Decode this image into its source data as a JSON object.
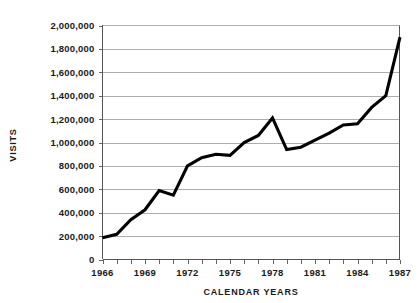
{
  "chart_data": {
    "type": "line",
    "title": "",
    "xlabel": "CALENDAR YEARS",
    "ylabel": "VISITS",
    "x": [
      1966,
      1967,
      1968,
      1969,
      1970,
      1971,
      1972,
      1973,
      1974,
      1975,
      1976,
      1977,
      1978,
      1979,
      1980,
      1981,
      1982,
      1983,
      1984,
      1985,
      1986,
      1987
    ],
    "values": [
      185000,
      215000,
      340000,
      425000,
      590000,
      550000,
      800000,
      870000,
      900000,
      890000,
      1000000,
      1060000,
      1210000,
      940000,
      960000,
      1020000,
      1080000,
      1150000,
      1160000,
      1300000,
      1400000,
      1900000
    ],
    "series": [
      {
        "name": "Visits",
        "values": [
          185000,
          215000,
          340000,
          425000,
          590000,
          550000,
          800000,
          870000,
          900000,
          890000,
          1000000,
          1060000,
          1210000,
          940000,
          960000,
          1020000,
          1080000,
          1150000,
          1160000,
          1300000,
          1400000,
          1900000
        ]
      }
    ],
    "xlim": [
      1966,
      1987
    ],
    "ylim": [
      0,
      2000000
    ],
    "y_ticks": [
      0,
      200000,
      400000,
      600000,
      800000,
      1000000,
      1200000,
      1400000,
      1600000,
      1800000,
      2000000
    ],
    "y_tick_labels": [
      "0",
      "200,000",
      "400,000",
      "600,000",
      "800,000",
      "1,000,000",
      "1,200,000",
      "1,400,000",
      "1,600,000",
      "1,800,000",
      "2,000,000"
    ],
    "x_ticks": [
      1966,
      1967,
      1968,
      1969,
      1970,
      1971,
      1972,
      1973,
      1974,
      1975,
      1976,
      1977,
      1978,
      1979,
      1980,
      1981,
      1982,
      1983,
      1984,
      1985,
      1986,
      1987
    ],
    "x_tick_labels_shown": [
      "1966",
      "1969",
      "1972",
      "1975",
      "1978",
      "1981",
      "1984",
      "1987"
    ],
    "x_tick_label_values": [
      1966,
      1969,
      1972,
      1975,
      1978,
      1981,
      1984,
      1987
    ],
    "grid": true,
    "grid_axis": "y",
    "legend": false,
    "legend_position": "none",
    "line_color": "#000000",
    "grid_color": "#9a9a9a",
    "background_color": "#ffffff"
  },
  "axes": {
    "y_label": "VISITS",
    "x_label": "CALENDAR YEARS"
  }
}
